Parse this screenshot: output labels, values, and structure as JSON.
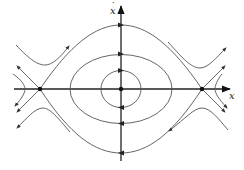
{
  "figure": {
    "type": "phase-portrait",
    "axes": {
      "x_label": "x",
      "y_label": "x",
      "y_label_accent": "˙"
    },
    "equilibria": [
      {
        "kind": "saddle",
        "name": "left-saddle",
        "px": [
          40,
          89
        ]
      },
      {
        "kind": "center",
        "name": "origin-center",
        "px": [
          121,
          89
        ]
      },
      {
        "kind": "saddle",
        "name": "right-saddle",
        "px": [
          202,
          89
        ]
      }
    ],
    "orbits": [
      {
        "name": "inner-closed-orbit",
        "direction": "clockwise"
      },
      {
        "name": "middle-closed-orbit",
        "direction": "clockwise"
      },
      {
        "name": "heteroclinic-separatrix",
        "direction": "clockwise"
      },
      {
        "name": "outer-trajectories",
        "direction": "outward"
      }
    ],
    "colors": {
      "stroke": "#555555",
      "axis": "#222222",
      "background": "#ffffff"
    }
  }
}
